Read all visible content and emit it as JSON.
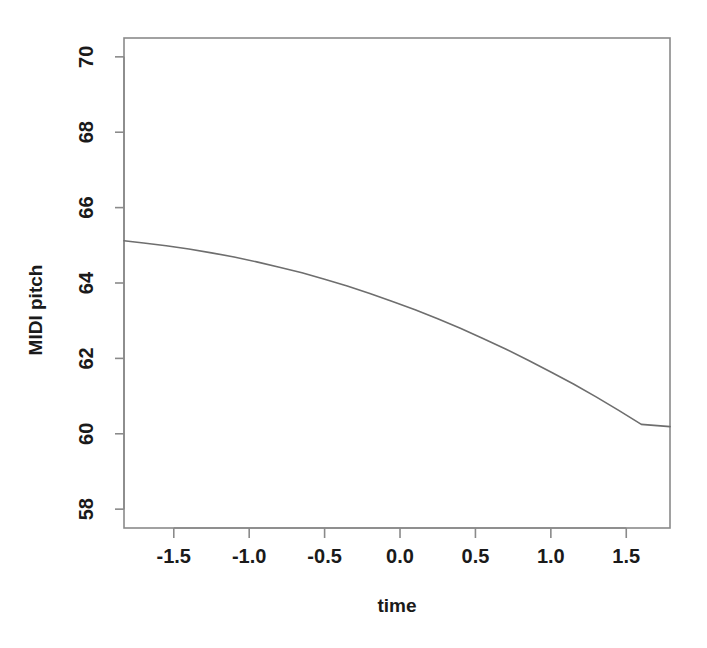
{
  "chart_data": {
    "type": "line",
    "title": "",
    "subtitle": "",
    "xlabel": "time",
    "ylabel": "MIDI pitch",
    "xlim": [
      -1.83,
      1.79
    ],
    "ylim": [
      57.5,
      70.5
    ],
    "xticks": [
      -1.5,
      -1.0,
      -0.5,
      0.0,
      0.5,
      1.0,
      1.5
    ],
    "xticklabels": [
      "-1.5",
      "-1.0",
      "-0.5",
      "0.0",
      "0.5",
      "1.0",
      "1.5"
    ],
    "yticks": [
      58,
      60,
      62,
      64,
      66,
      68,
      70
    ],
    "yticklabels": [
      "58",
      "60",
      "62",
      "64",
      "66",
      "68",
      "70"
    ],
    "grid": false,
    "legend": null,
    "box": true,
    "series": [
      {
        "name": "fitted pitch",
        "color": "#6e6e6e",
        "linewidth": 1.6,
        "x": [
          -1.83,
          -1.7,
          -1.55,
          -1.4,
          -1.25,
          -1.1,
          -0.95,
          -0.8,
          -0.65,
          -0.5,
          -0.35,
          -0.2,
          -0.05,
          0.1,
          0.25,
          0.4,
          0.55,
          0.7,
          0.85,
          1.0,
          1.15,
          1.3,
          1.45,
          1.6,
          1.79
        ],
        "y": [
          65.12,
          65.06,
          64.99,
          64.9,
          64.8,
          64.69,
          64.56,
          64.42,
          64.27,
          64.1,
          63.92,
          63.72,
          63.51,
          63.29,
          63.05,
          62.8,
          62.53,
          62.25,
          61.95,
          61.64,
          61.32,
          60.98,
          60.62,
          60.25,
          60.19
        ]
      }
    ],
    "annotations": []
  },
  "axes": {
    "x_axis_name": "time-axis",
    "y_axis_name": "midi-pitch-axis"
  }
}
